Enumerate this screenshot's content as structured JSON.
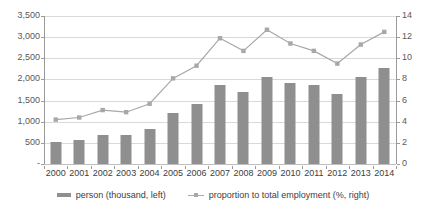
{
  "chart_data": {
    "type": "bar",
    "title": "",
    "xlabel": "",
    "ylabel": "",
    "categories": [
      "2000",
      "2001",
      "2002",
      "2003",
      "2004",
      "2005",
      "2006",
      "2007",
      "2008",
      "2009",
      "2010",
      "2011",
      "2012",
      "2013",
      "2014"
    ],
    "series": [
      {
        "name": "person (thousand, left)",
        "type": "bar",
        "axis": "left",
        "color": "#8f8f8f",
        "values": [
          520,
          580,
          690,
          680,
          840,
          1200,
          1420,
          1870,
          1715,
          2070,
          1920,
          1870,
          1660,
          2050,
          2280
        ]
      },
      {
        "name": "proportion to total employment (%, right)",
        "type": "line",
        "axis": "right",
        "color": "#a8a8a8",
        "values": [
          4.2,
          4.4,
          5.1,
          4.9,
          5.7,
          8.1,
          9.3,
          11.9,
          10.7,
          12.7,
          11.4,
          10.7,
          9.5,
          11.3,
          12.5
        ]
      }
    ],
    "left_axis": {
      "label": "person (thousand)",
      "min": 0,
      "max": 3500,
      "step": 500,
      "ticks": [
        "-",
        "500",
        "1,000",
        "1,500",
        "2,000",
        "2,500",
        "3,000",
        "3,500"
      ],
      "tick_values": [
        0,
        500,
        1000,
        1500,
        2000,
        2500,
        3000,
        3500
      ]
    },
    "right_axis": {
      "label": "proportion to total employment (%)",
      "min": 0,
      "max": 14,
      "step": 2,
      "ticks": [
        "0",
        "2",
        "4",
        "6",
        "8",
        "10",
        "12",
        "14"
      ],
      "tick_values": [
        0,
        2,
        4,
        6,
        8,
        10,
        12,
        14
      ]
    },
    "grid": true,
    "legend_position": "bottom"
  },
  "legend": {
    "entries": [
      {
        "label": "person (thousand, left)",
        "marker": "bar-swatch"
      },
      {
        "label": "proportion to total employment (%, right)",
        "marker": "line-marker-swatch"
      }
    ]
  },
  "colors": {
    "bar": "#8f8f8f",
    "line": "#a8a8a8",
    "grid": "#d9d9d9",
    "axis": "#9a9a9a",
    "text": "#404040",
    "background": "#ffffff"
  }
}
